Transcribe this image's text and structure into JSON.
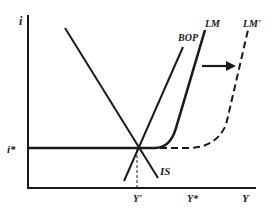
{
  "diagram": {
    "axes": {
      "y_label": "i",
      "x_label": "Y"
    },
    "levels": {
      "interest_rate_label": "i*",
      "output_initial_label": "Y'",
      "output_target_label": "Y*"
    },
    "curves": {
      "is_label": "IS",
      "bop_label": "BOP",
      "lm_label": "LM",
      "lm_shifted_label": "LM'"
    },
    "colors": {
      "line": "#1a1a1a",
      "background": "#ffffff"
    }
  }
}
